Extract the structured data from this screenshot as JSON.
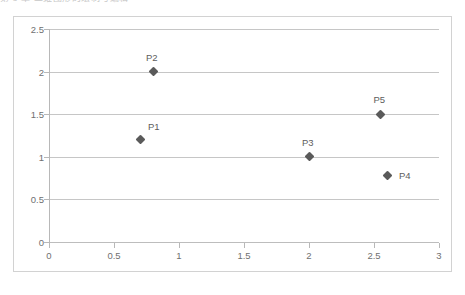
{
  "page": {
    "top_clipped_text": "第 8 章 二维图形的绘制与编辑"
  },
  "chart": {
    "frame_border_color": "#d2d2d2",
    "gridline_color": "#c6c6c6",
    "marker_color": "#5a5a5a",
    "label_color": "#707070"
  },
  "chart_data": {
    "type": "scatter",
    "title": "",
    "subtitle": "",
    "xlabel": "",
    "ylabel": "",
    "xlim": [
      0,
      3
    ],
    "ylim": [
      0,
      2.5
    ],
    "xticks": [
      "0",
      "0.5",
      "1",
      "1.5",
      "2",
      "2.5",
      "3"
    ],
    "xtick_values": [
      0,
      0.5,
      1,
      1.5,
      2,
      2.5,
      3
    ],
    "yticks": [
      "0",
      "0.5",
      "1",
      "1.5",
      "2",
      "2.5"
    ],
    "ytick_values": [
      0,
      0.5,
      1,
      1.5,
      2,
      2.5
    ],
    "grid": "horizontal",
    "legend": "none",
    "points": [
      {
        "label": "P1",
        "x": 0.7,
        "y": 1.2,
        "label_pos": "above-right"
      },
      {
        "label": "P2",
        "x": 0.8,
        "y": 2.0,
        "label_pos": "above"
      },
      {
        "label": "P3",
        "x": 2.0,
        "y": 1.0,
        "label_pos": "above"
      },
      {
        "label": "P4",
        "x": 2.6,
        "y": 0.78,
        "label_pos": "right"
      },
      {
        "label": "P5",
        "x": 2.55,
        "y": 1.5,
        "label_pos": "above"
      }
    ]
  }
}
